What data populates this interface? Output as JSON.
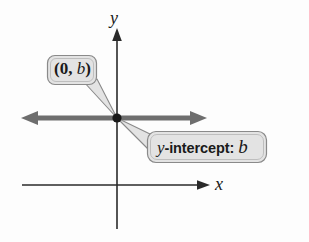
{
  "figure": {
    "name": "y-intercept-diagram",
    "background_color": "#fdfdfd"
  },
  "axes": {
    "y_label": "y",
    "x_label": "x",
    "axis_color": "#2a2a2a",
    "origin_px": {
      "x": 117,
      "y": 118
    },
    "x_axis_y_px": 185,
    "y_axis_x_px": 117
  },
  "line": {
    "name": "horizontal-line",
    "color": "#6e6e6e",
    "description": "thick horizontal double-arrow line through the y-intercept",
    "y_px": 118,
    "x_start_px": 22,
    "x_end_px": 207
  },
  "point": {
    "name": "intercept-point",
    "color": "#1a1a1a",
    "x_px": 117,
    "y_px": 118
  },
  "callouts": [
    {
      "id": "point-label",
      "text_prefix": "(0, ",
      "text_var": "b",
      "text_suffix": ")",
      "full_text": "(0, b)",
      "fill": "#e3e3e3",
      "stroke": "#8a8a8a"
    },
    {
      "id": "intercept-label",
      "text_var": "y",
      "text_middle": "-intercept: ",
      "text_var2": "b",
      "full_text": "y-intercept: b",
      "fill": "#e3e3e3",
      "stroke": "#8a8a8a"
    }
  ],
  "colors": {
    "bubble_fill": "#e3e3e3",
    "bubble_stroke": "#8a8a8a",
    "line_gray": "#6e6e6e",
    "ink": "#1a1a1a"
  }
}
